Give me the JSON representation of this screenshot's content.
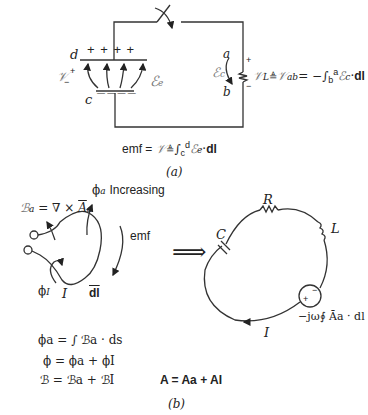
{
  "figure_a": {
    "caption": "(a)",
    "node_d": "d",
    "node_c": "c",
    "plate_top_charges": "+ +   + +",
    "plate_bottom_charges": "— —  — —",
    "source_voltage": "𝒱",
    "source_plus": "+",
    "source_minus": "−",
    "field_e_label": "ℰ",
    "field_e_sub": "e",
    "field_c_label": "ℰ",
    "field_c_sub": "c",
    "node_a": "a",
    "node_b": "b",
    "load_plus": "+",
    "load_minus": "−",
    "load_equation": "𝒱L ≜ 𝒱ab = −∫ba ℰc · dl",
    "load_eq_parts": {
      "v": "𝒱",
      "vsub": "L",
      "def": "≜",
      "v2": "𝒱",
      "v2sub": "ab",
      "rest": "= −∫",
      "lower": "b",
      "upper": "a",
      "e": "ℰ",
      "esub": "c",
      "dot": "·",
      "dl": "dl"
    },
    "emf_equation": "emf = 𝒱 ≜ ∫cd ℰe · dl",
    "emf_parts": {
      "emf": "emf =",
      "v": "𝒱",
      "def": "≜",
      "int": "∫",
      "lower": "c",
      "upper": "d",
      "e": "ℰ",
      "esub": "e",
      "dot": "·",
      "dl": "dl"
    }
  },
  "figure_b": {
    "caption": "(b)",
    "b_equation": {
      "b": "ℬ",
      "bsub": "a",
      "rest": "= ∇ × ",
      "a": "A",
      "asub": "a"
    },
    "phi_a_increasing": {
      "phi": "ϕ",
      "sub": "a",
      "text": "Increasing"
    },
    "emf_label": "emf",
    "phi_i": {
      "phi": "ϕ",
      "sub": "I"
    },
    "current_label": "I",
    "dl_label": "dl",
    "implies": "⟹",
    "circuit": {
      "R": "R",
      "L": "L",
      "C": "C",
      "I": "I",
      "source_plus": "+",
      "source_minus": "−",
      "source_equation": "−jω∮ Āa · dl"
    },
    "equations": [
      "ϕa = ∫ ℬa · ds",
      "ϕ = ϕa + ϕI",
      "ℬ = ℬa + ℬI"
    ],
    "a_total_equation": "A = Aa + AI"
  }
}
